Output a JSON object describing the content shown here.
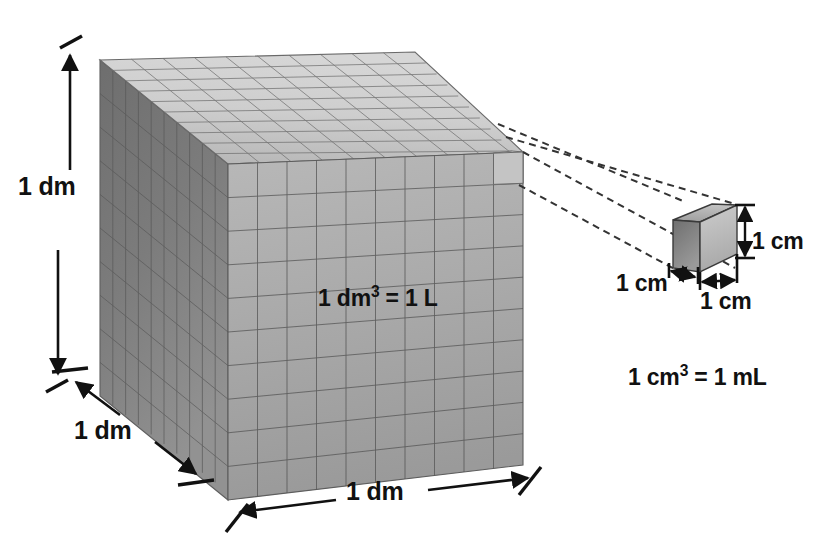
{
  "figure": {
    "background_color": "#ffffff",
    "ink_color": "#111111"
  },
  "large_cube": {
    "name": "cubic-decimeter-cube",
    "divisions_per_edge": 10,
    "unit_cubes_visible_per_face": 100,
    "faces": {
      "top_color": "#c9c9c9",
      "front_color": "#a8a8a8",
      "left_color": "#777777",
      "grid_line_color": "#5c5c5c"
    },
    "labels": {
      "height": "1 dm",
      "depth": "1 dm",
      "width": "1 dm",
      "volume_prefix": "1 dm",
      "volume_exponent": "3",
      "volume_suffix": " = 1 L",
      "volume_full": "1 dm³ = 1 L"
    }
  },
  "small_cube": {
    "name": "cubic-centimeter-cube",
    "faces": {
      "top_color": "#b0b0b0",
      "front_color": "#bcbcbc",
      "left_color": "#8a8a8a",
      "edge_color": "#3a3a3a"
    },
    "labels": {
      "height": "1 cm",
      "depth": "1 cm",
      "width": "1 cm",
      "volume_prefix": "1 cm",
      "volume_exponent": "3",
      "volume_suffix": " = 1 mL",
      "volume_full": "1 cm³ = 1 mL"
    }
  },
  "callout": {
    "name": "magnification-callout",
    "style": "dashed",
    "line_count": 4,
    "color": "#333333",
    "dash_pattern": "7 5"
  },
  "dimension_arrows": [
    {
      "name": "height-arrow-large",
      "label": "1 dm",
      "orientation": "vertical",
      "double_headed": true
    },
    {
      "name": "depth-arrow-large",
      "label": "1 dm",
      "orientation": "diagonal",
      "double_headed": true
    },
    {
      "name": "width-arrow-large",
      "label": "1 dm",
      "orientation": "horizontal",
      "double_headed": true
    },
    {
      "name": "height-arrow-small",
      "label": "1 cm",
      "orientation": "vertical",
      "double_headed": true
    },
    {
      "name": "depth-arrow-small",
      "label": "1 cm",
      "orientation": "diagonal",
      "double_headed": true
    },
    {
      "name": "width-arrow-small",
      "label": "1 cm",
      "orientation": "horizontal",
      "double_headed": true
    }
  ]
}
